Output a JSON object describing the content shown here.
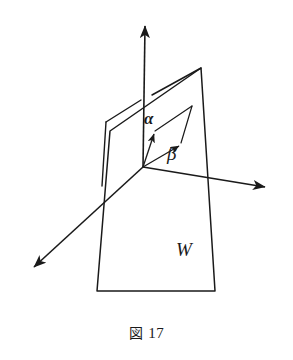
{
  "figure": {
    "caption_label": "図",
    "caption_number": "17",
    "caption_full": "図 17",
    "background_color": "#ffffff",
    "ink_color": "#1a1a1a",
    "labels": {
      "alpha": "α",
      "beta": "β",
      "subspace": "W"
    },
    "geometry": {
      "origin": {
        "x": 143,
        "y": 167
      },
      "axes": [
        {
          "name": "vertical-axis",
          "from": {
            "x": 143,
            "y": 167
          },
          "to": {
            "x": 145,
            "y": 24
          },
          "arrow": "end"
        },
        {
          "name": "right-axis",
          "from": {
            "x": 143,
            "y": 167
          },
          "to": {
            "x": 268,
            "y": 188
          },
          "arrow": "end"
        },
        {
          "name": "front-left-axis",
          "from": {
            "x": 143,
            "y": 167
          },
          "to": {
            "x": 31,
            "y": 270
          },
          "arrow": "end"
        }
      ],
      "vectors": [
        {
          "name": "alpha-vector",
          "from": {
            "x": 143,
            "y": 167
          },
          "to": {
            "x": 155,
            "y": 131
          },
          "arrow": "end"
        },
        {
          "name": "beta-vector",
          "from": {
            "x": 143,
            "y": 167
          },
          "to": {
            "x": 181,
            "y": 143
          },
          "arrow": "end"
        }
      ],
      "parallelogram": [
        {
          "x": 143,
          "y": 167
        },
        {
          "x": 155,
          "y": 131
        },
        {
          "x": 192,
          "y": 106
        },
        {
          "x": 181,
          "y": 143
        }
      ],
      "plane_w": [
        {
          "x": 201,
          "y": 68
        },
        {
          "x": 215,
          "y": 291
        },
        {
          "x": 97,
          "y": 291
        },
        {
          "x": 110,
          "y": 131
        }
      ],
      "plane_w_back_edge": {
        "from": {
          "x": 201,
          "y": 68
        },
        "to": {
          "x": 152,
          "y": 95
        }
      },
      "side_panel": [
        {
          "x": 106,
          "y": 122
        },
        {
          "x": 141,
          "y": 100
        },
        {
          "x": 137,
          "y": 165
        },
        {
          "x": 102,
          "y": 186
        }
      ]
    }
  }
}
